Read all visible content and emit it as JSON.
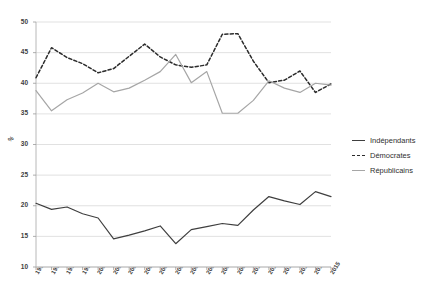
{
  "chart_data": {
    "type": "line",
    "title": "",
    "xlabel": "",
    "ylabel": "%",
    "ylim": [
      10,
      50
    ],
    "ytick_step": 5,
    "yticks": [
      10,
      15,
      20,
      25,
      30,
      35,
      40,
      45,
      50
    ],
    "grid": true,
    "legend_position": "right",
    "x": [
      "1996",
      "1997",
      "1998",
      "1999",
      "2000",
      "2001",
      "2002",
      "2003",
      "2004",
      "2005",
      "2006",
      "2007",
      "2008",
      "2009",
      "2010",
      "2011",
      "2012",
      "2013",
      "2014",
      "2015"
    ],
    "categories": [
      "1996",
      "1997",
      "1998",
      "1999",
      "2000",
      "2001",
      "2002",
      "2003",
      "2004",
      "2005",
      "2006",
      "2007",
      "2008",
      "2009",
      "2010",
      "2011",
      "2012",
      "2013",
      "2014",
      "2015"
    ],
    "series": [
      {
        "name": "Indépendants",
        "style": "solid",
        "color": "#3f3f3f",
        "values": [
          20.4,
          19.4,
          19.8,
          18.7,
          18.0,
          14.6,
          15.2,
          15.9,
          16.7,
          13.8,
          16.1,
          16.6,
          17.1,
          16.8,
          19.3,
          21.5,
          20.8,
          20.2,
          22.3,
          21.5
        ]
      },
      {
        "name": "Démocrates",
        "style": "dashed",
        "color": "#2b2b2b",
        "values": [
          40.9,
          45.8,
          44.2,
          43.2,
          41.7,
          42.4,
          44.4,
          46.4,
          44.3,
          43.0,
          42.6,
          43.0,
          48.0,
          48.1,
          43.6,
          40.1,
          40.5,
          42.0,
          38.5,
          39.9
        ]
      },
      {
        "name": "Républicains",
        "style": "solid",
        "color": "#a6a6a6",
        "values": [
          38.8,
          35.5,
          37.3,
          38.4,
          40.0,
          38.6,
          39.2,
          40.5,
          41.9,
          44.7,
          40.1,
          41.9,
          35.1,
          35.1,
          37.2,
          40.4,
          39.2,
          38.5,
          40.0,
          39.7
        ]
      }
    ]
  },
  "legend": {
    "items": [
      {
        "label": "Indépendants",
        "style": "solid",
        "color": "#3f3f3f"
      },
      {
        "label": "Démocrates",
        "style": "dashed",
        "color": "#2b2b2b"
      },
      {
        "label": "Républicains",
        "style": "solid",
        "color": "#a6a6a6"
      }
    ]
  },
  "axes": {
    "y_unit": "%"
  }
}
